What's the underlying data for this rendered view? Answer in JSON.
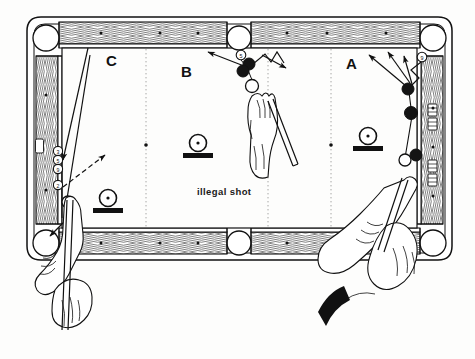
{
  "figure": {
    "type": "pool-table-diagram",
    "caption": "illegal shot",
    "background_color": "#fdfdfc",
    "ink_color": "#111111"
  },
  "zones": [
    {
      "id": "C",
      "label": "C",
      "x": 112,
      "y": 61
    },
    {
      "id": "B",
      "label": "B",
      "x": 186,
      "y": 72
    },
    {
      "id": "A",
      "label": "A",
      "x": 352,
      "y": 63
    }
  ],
  "table": {
    "outer": {
      "x": 27,
      "y": 17,
      "width": 425,
      "height": 243
    },
    "cloth": {
      "x": 62,
      "y": 45,
      "width": 355,
      "height": 186
    },
    "rail_color": "#ffffff",
    "pockets": [
      {
        "name": "top-left-corner-pocket",
        "cx": 46,
        "cy": 38,
        "r": 13
      },
      {
        "name": "top-side-pocket",
        "cx": 239,
        "cy": 38,
        "r": 12
      },
      {
        "name": "top-right-corner-pocket",
        "cx": 433,
        "cy": 38,
        "r": 13
      },
      {
        "name": "bottom-left-corner-pocket",
        "cx": 46,
        "cy": 243,
        "r": 13
      },
      {
        "name": "bottom-side-pocket",
        "cx": 239,
        "cy": 243,
        "r": 12
      },
      {
        "name": "bottom-right-corner-pocket",
        "cx": 433,
        "cy": 243,
        "r": 13
      }
    ],
    "diamonds_top": [
      101,
      160,
      198,
      287,
      327,
      386
    ],
    "diamonds_bottom": [
      101,
      160,
      198,
      287,
      327,
      386
    ],
    "diamonds_left": [
      95,
      190
    ],
    "diamonds_right": [
      108,
      147,
      196
    ],
    "dotted_division_lines": [
      146,
      268,
      331
    ]
  },
  "balls": {
    "numbered": [
      {
        "number": "3",
        "cx": 58,
        "cy": 151,
        "zone": "C"
      },
      {
        "number": "5",
        "cx": 58,
        "cy": 159,
        "zone": "C"
      },
      {
        "number": "9",
        "cx": 58,
        "cy": 167,
        "zone": "C"
      },
      {
        "number": "2",
        "cx": 58,
        "cy": 183,
        "zone": "C"
      },
      {
        "number": "5",
        "cx": 241,
        "cy": 55,
        "zone": "B"
      },
      {
        "number": "9",
        "cx": 422,
        "cy": 57,
        "zone": "A"
      }
    ],
    "object_balls": [
      {
        "cx": 249,
        "cy": 64,
        "zone": "B"
      },
      {
        "cx": 243,
        "cy": 71,
        "zone": "B"
      },
      {
        "cx": 408,
        "cy": 89,
        "zone": "A"
      },
      {
        "cx": 411,
        "cy": 113,
        "zone": "A"
      },
      {
        "cx": 416,
        "cy": 155,
        "zone": "A"
      }
    ],
    "cue_balls": [
      {
        "cx": 68,
        "cy": 202,
        "zone": "C"
      },
      {
        "cx": 252,
        "cy": 86,
        "zone": "B"
      },
      {
        "cx": 405,
        "cy": 160,
        "zone": "A"
      }
    ]
  },
  "markers": [
    {
      "name": "ball-on-base-marker",
      "cx": 108,
      "cy": 200,
      "zone": "C"
    },
    {
      "name": "ball-on-base-marker",
      "cx": 198,
      "cy": 145,
      "zone": "B"
    },
    {
      "name": "ball-on-base-marker",
      "cx": 368,
      "cy": 138,
      "zone": "A"
    }
  ],
  "players": [
    {
      "name": "player-hand-left",
      "zone": "C",
      "cue": "cue-stick"
    },
    {
      "name": "player-hand-center",
      "zone": "B",
      "cue": "cue-stick"
    },
    {
      "name": "player-hand-right",
      "zone": "A",
      "cue": "cue-stick"
    }
  ]
}
